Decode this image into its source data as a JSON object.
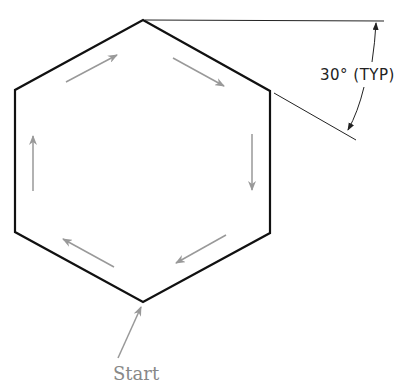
{
  "diagram": {
    "type": "hexagon-drawing-sequence",
    "shape": "regular hexagon (flat sides vertical)",
    "vertices": {
      "top": [
        143,
        20
      ],
      "upper_left": [
        15,
        90
      ],
      "lower_left": [
        15,
        232
      ],
      "bottom": [
        143,
        302
      ],
      "lower_right": [
        270,
        233
      ],
      "upper_right": [
        270,
        91
      ]
    },
    "direction_arrows_count": 6,
    "direction": "clockwise starting at bottom vertex",
    "colors": {
      "outline": "#111111",
      "arrows": "#999999",
      "dimension": "#222222",
      "label": "#888888"
    }
  },
  "dimension": {
    "angle_label": "30° (TYP)"
  },
  "labels": {
    "start": "Start"
  }
}
